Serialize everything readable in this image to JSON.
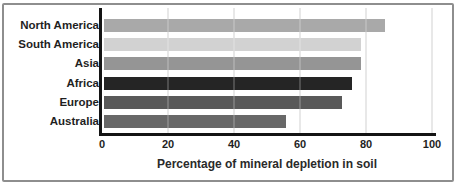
{
  "chart_data": {
    "type": "bar",
    "orientation": "horizontal",
    "title": "",
    "xlabel": "Percentage of mineral depletion in soil",
    "ylabel": "",
    "categories": [
      "North America",
      "South America",
      "Asia",
      "Africa",
      "Europe",
      "Australia"
    ],
    "values": [
      85,
      78,
      78,
      75,
      72,
      55
    ],
    "xlim": [
      0,
      100
    ],
    "xticks": [
      0,
      20,
      40,
      60,
      80,
      100
    ],
    "grid": "vertical",
    "legend": "none",
    "bar_colors": [
      "#a9a9a9",
      "#d2d2d2",
      "#959595",
      "#252525",
      "#595959",
      "#686868"
    ],
    "axis_color": "#141414",
    "gridline_color": "#c8c8c8",
    "border_color": "#8e8e8e"
  }
}
